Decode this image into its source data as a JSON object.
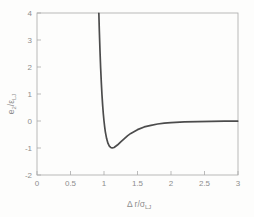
{
  "figure": {
    "background": "#fdfdfc",
    "frame_color": "#a9a9a9",
    "tick_color": "#a9a9a9",
    "curve_color": "#4c4c4c",
    "text_color": "#8d8d8d"
  },
  "chart_data": {
    "type": "line",
    "title": "",
    "xlabel": "Δ r/σ_LJ",
    "ylabel": "e_2/ε_LJ",
    "xlabel_parts": {
      "main": "Δ r/σ",
      "sub": "LJ"
    },
    "ylabel_parts": {
      "base": "e",
      "base_sub": "2",
      "mid": "/ε",
      "mid_sub": "LJ"
    },
    "xlim": [
      0,
      3
    ],
    "ylim": [
      -2,
      4
    ],
    "grid": false,
    "legend": "none",
    "xticks": [
      0,
      0.5,
      1,
      1.5,
      2,
      2.5,
      3
    ],
    "xtick_labels": [
      "0",
      "0.5",
      "1",
      "1.5",
      "2",
      "2.5",
      "3"
    ],
    "yticks": [
      4,
      3,
      2,
      1,
      0,
      -1,
      -2
    ],
    "ytick_labels": [
      "4",
      "3",
      "2",
      "1",
      "0",
      "-1",
      "-2"
    ],
    "series": [
      {
        "name": "Lennard-Jones pair potential",
        "x": [
          0.923,
          0.93,
          0.94,
          0.95,
          0.96,
          0.97,
          0.98,
          0.99,
          1.0,
          1.01,
          1.02,
          1.04,
          1.06,
          1.08,
          1.1,
          1.122,
          1.15,
          1.2,
          1.25,
          1.3,
          1.35,
          1.4,
          1.5,
          1.6,
          1.7,
          1.8,
          1.9,
          2.0,
          2.2,
          2.4,
          2.6,
          2.8,
          3.0
        ],
        "y": [
          4.0,
          3.37,
          2.61,
          1.96,
          1.42,
          0.96,
          0.58,
          0.26,
          0.0,
          -0.22,
          -0.4,
          -0.66,
          -0.83,
          -0.93,
          -0.98,
          -1.0,
          -0.98,
          -0.89,
          -0.77,
          -0.66,
          -0.55,
          -0.46,
          -0.32,
          -0.22,
          -0.16,
          -0.11,
          -0.08,
          -0.06,
          -0.035,
          -0.021,
          -0.013,
          -0.008,
          -0.006
        ]
      }
    ]
  }
}
